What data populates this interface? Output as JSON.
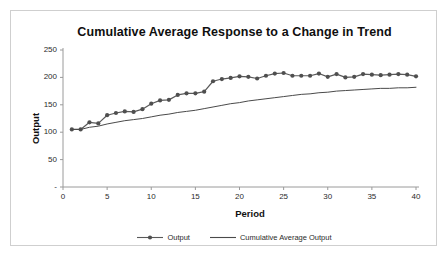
{
  "chart_data": {
    "type": "line",
    "title": "Cumulative Average Response to a Change in Trend",
    "xlabel": "Period",
    "ylabel": "Output",
    "xlim": [
      0,
      40
    ],
    "ylim": [
      0,
      250
    ],
    "xticks": [
      "0",
      "5",
      "10",
      "15",
      "20",
      "25",
      "30",
      "35",
      "40"
    ],
    "xtick_values": [
      0,
      5,
      10,
      15,
      20,
      25,
      30,
      35,
      40
    ],
    "yticks": [
      "-",
      "50",
      "100",
      "150",
      "200",
      "250"
    ],
    "ytick_values": [
      0,
      50,
      100,
      150,
      200,
      250
    ],
    "grid": false,
    "legend_position": "bottom",
    "x": [
      1,
      2,
      3,
      4,
      5,
      6,
      7,
      8,
      9,
      10,
      11,
      12,
      13,
      14,
      15,
      16,
      17,
      18,
      19,
      20,
      21,
      22,
      23,
      24,
      25,
      26,
      27,
      28,
      29,
      30,
      31,
      32,
      33,
      34,
      35,
      36,
      37,
      38,
      39,
      40
    ],
    "series": [
      {
        "name": "Output",
        "color": "#595959",
        "marker": "circle",
        "values": [
          105,
          105,
          118,
          116,
          131,
          135,
          138,
          137,
          142,
          152,
          158,
          159,
          168,
          171,
          171,
          174,
          193,
          197,
          199,
          202,
          201,
          198,
          203,
          207,
          208,
          203,
          203,
          203,
          207,
          201,
          206,
          200,
          201,
          206,
          205,
          204,
          205,
          206,
          205,
          202
        ]
      },
      {
        "name": "Cumulative Average Output",
        "color": "#4a4a4a",
        "marker": "none",
        "values": [
          105,
          105,
          109,
          111,
          115,
          118,
          121,
          123,
          125,
          128,
          131,
          133,
          136,
          138,
          140,
          143,
          146,
          149,
          152,
          154,
          157,
          159,
          161,
          163,
          165,
          167,
          169,
          170,
          172,
          173,
          175,
          176,
          177,
          178,
          179,
          180,
          180,
          181,
          181,
          182
        ]
      }
    ]
  }
}
